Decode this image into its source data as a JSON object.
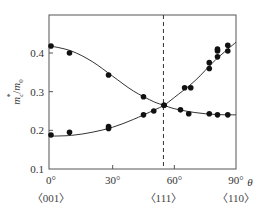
{
  "chart_data": {
    "type": "scatter",
    "title": "",
    "xlabel": "θ",
    "ylabel": "m*c/m0",
    "ylabel_parts": {
      "main": "m",
      "sup": "*",
      "sub": "c",
      "denom": "m",
      "denom_sub": "0"
    },
    "xlim": [
      0,
      90
    ],
    "ylim": [
      0.1,
      0.5
    ],
    "x_ticks": [
      0,
      30,
      60,
      90
    ],
    "x_tick_labels": [
      "0°",
      "30°",
      "60°",
      "90°"
    ],
    "y_ticks": [
      0.1,
      0.2,
      0.3,
      0.4
    ],
    "y_tick_labels": [
      "0.1",
      "0.2",
      "0.3",
      "0.4"
    ],
    "direction_labels": [
      {
        "x": 0,
        "label": "〈001〉"
      },
      {
        "x": 54.7,
        "label": "〈111〉"
      },
      {
        "x": 90,
        "label": "〈110〉"
      }
    ],
    "reference_line": {
      "x": 54.7,
      "style": "dashed",
      "note": "〈111〉 direction"
    },
    "grid": false,
    "legend": null,
    "series": [
      {
        "name": "decreasing branch",
        "points": [
          [
            0,
            0.418
          ],
          [
            9,
            0.4
          ],
          [
            28,
            0.343
          ],
          [
            45,
            0.287
          ],
          [
            55,
            0.265
          ],
          [
            63,
            0.253
          ],
          [
            67,
            0.243
          ],
          [
            77,
            0.243
          ],
          [
            81,
            0.24
          ],
          [
            86,
            0.24
          ]
        ],
        "fit_curve": [
          [
            0,
            0.418
          ],
          [
            10,
            0.405
          ],
          [
            20,
            0.378
          ],
          [
            30,
            0.34
          ],
          [
            40,
            0.302
          ],
          [
            50,
            0.274
          ],
          [
            55,
            0.265
          ],
          [
            60,
            0.256
          ],
          [
            70,
            0.246
          ],
          [
            80,
            0.241
          ],
          [
            90,
            0.24
          ]
        ]
      },
      {
        "name": "increasing branch",
        "points": [
          [
            0,
            0.188
          ],
          [
            9,
            0.195
          ],
          [
            28,
            0.205
          ],
          [
            28,
            0.21
          ],
          [
            45,
            0.24
          ],
          [
            50,
            0.25
          ],
          [
            55,
            0.265
          ],
          [
            65,
            0.31
          ],
          [
            68,
            0.31
          ],
          [
            77,
            0.36
          ],
          [
            77,
            0.375
          ],
          [
            81,
            0.39
          ],
          [
            81,
            0.405
          ],
          [
            81,
            0.41
          ],
          [
            86,
            0.405
          ],
          [
            86,
            0.42
          ]
        ],
        "fit_curve": [
          [
            0,
            0.185
          ],
          [
            10,
            0.187
          ],
          [
            20,
            0.195
          ],
          [
            30,
            0.208
          ],
          [
            40,
            0.228
          ],
          [
            50,
            0.252
          ],
          [
            55,
            0.265
          ],
          [
            60,
            0.285
          ],
          [
            70,
            0.328
          ],
          [
            80,
            0.382
          ],
          [
            90,
            0.428
          ]
        ]
      }
    ],
    "colors": {
      "axis": "#555555",
      "points": "#111111",
      "curve": "#333333",
      "dashed": "#333333"
    }
  }
}
